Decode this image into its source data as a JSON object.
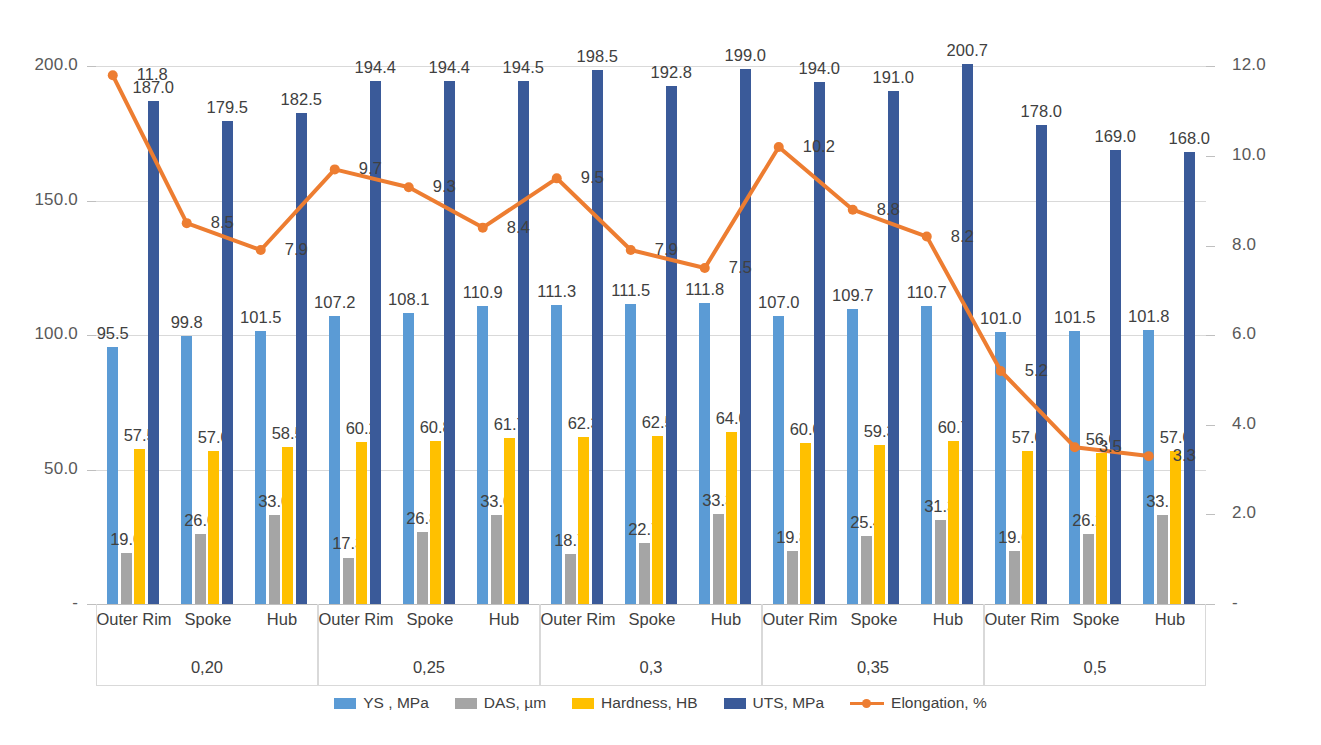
{
  "chart_data": {
    "type": "bar",
    "title": "",
    "subtitle": "",
    "xlabel": "",
    "ylabel": "",
    "y2label": "",
    "grid": true,
    "legend_position": "bottom",
    "groups": [
      "0,20",
      "0,25",
      "0,3",
      "0,35",
      "0,5"
    ],
    "subcategories": [
      "Outer Rim",
      "Spoke",
      "Hub"
    ],
    "categories": [
      "0,20 Outer Rim",
      "0,20 Spoke",
      "0,20 Hub",
      "0,25 Outer Rim",
      "0,25 Spoke",
      "0,25 Hub",
      "0,3 Outer Rim",
      "0,3 Spoke",
      "0,3 Hub",
      "0,35 Outer Rim",
      "0,35 Spoke",
      "0,35 Hub",
      "0,5 Outer Rim",
      "0,5 Spoke",
      "0,5 Hub"
    ],
    "axis_left": {
      "ticks": [
        "-",
        "50.0",
        "100.0",
        "150.0",
        "200.0"
      ],
      "values": [
        0,
        50,
        100,
        150,
        200
      ],
      "ylim": [
        0,
        215
      ]
    },
    "axis_right": {
      "ticks": [
        "-",
        "2.0",
        "4.0",
        "6.0",
        "8.0",
        "10.0",
        "12.0"
      ],
      "values": [
        0,
        2,
        4,
        6,
        8,
        10,
        12
      ],
      "ylim": [
        0,
        12.9
      ]
    },
    "series": [
      {
        "name": "YS , MPa",
        "type": "bar",
        "axis": "left",
        "color": "#5b9bd5",
        "values": [
          95.5,
          99.8,
          101.5,
          107.2,
          108.1,
          110.9,
          111.3,
          111.5,
          111.8,
          107.0,
          109.7,
          110.7,
          101.0,
          101.5,
          101.8
        ],
        "labels": [
          "95.5",
          "99.8",
          "101.5",
          "107.2",
          "108.1",
          "110.9",
          "111.3",
          "111.5",
          "111.8",
          "107.0",
          "109.7",
          "110.7",
          "101.0",
          "101.5",
          "101.8"
        ]
      },
      {
        "name": "DAS, µm",
        "type": "bar",
        "axis": "left",
        "color": "#a5a5a5",
        "values": [
          19.0,
          26.0,
          33.0,
          17.3,
          26.8,
          33.0,
          18.7,
          22.7,
          33.3,
          19.8,
          25.4,
          31.3,
          19.6,
          26.2,
          33.1
        ],
        "labels": [
          "19.0",
          "26.0",
          "33.0",
          "17.3",
          "26.8",
          "33.0",
          "18.7",
          "22.7",
          "33.3",
          "19.8",
          "25.4",
          "31.3",
          "19.6",
          "26.2",
          "33.1"
        ]
      },
      {
        "name": "Hardness, HB",
        "type": "bar",
        "axis": "left",
        "color": "#ffc000",
        "values": [
          57.5,
          57.0,
          58.5,
          60.2,
          60.8,
          61.7,
          62.3,
          62.5,
          64.0,
          60.0,
          59.3,
          60.7,
          57.0,
          56.0,
          57.0
        ],
        "labels": [
          "57.5",
          "57.0",
          "58.5",
          "60.2",
          "60.8",
          "61.7",
          "62.3",
          "62.5",
          "64.0",
          "60.0",
          "59.3",
          "60.7",
          "57.0",
          "56.0",
          "57.0"
        ]
      },
      {
        "name": "UTS, MPa",
        "type": "bar",
        "axis": "left",
        "color": "#3a5a99",
        "values": [
          187.0,
          179.5,
          182.5,
          194.4,
          194.4,
          194.5,
          198.5,
          192.8,
          199.0,
          194.0,
          191.0,
          200.7,
          178.0,
          169.0,
          168.0
        ],
        "labels": [
          "187.0",
          "179.5",
          "182.5",
          "194.4",
          "194.4",
          "194.5",
          "198.5",
          "192.8",
          "199.0",
          "194.0",
          "191.0",
          "200.7",
          "178.0",
          "169.0",
          "168.0"
        ]
      },
      {
        "name": "Elongation, %",
        "type": "line",
        "axis": "right",
        "color": "#ed7d31",
        "values": [
          11.8,
          8.5,
          7.9,
          9.7,
          9.3,
          8.4,
          9.5,
          7.9,
          7.5,
          10.2,
          8.8,
          8.2,
          5.2,
          3.5,
          3.3
        ],
        "labels": [
          "11.8",
          "8.5",
          "7.9",
          "9.7",
          "9.3",
          "8.4",
          "9.5",
          "7.9",
          "7.5",
          "10.2",
          "8.8",
          "8.2",
          "5.2",
          "3.5",
          "3.3"
        ]
      }
    ]
  },
  "legend": {
    "items": [
      {
        "label": "YS , MPa",
        "color": "#5b9bd5",
        "marker": "square"
      },
      {
        "label": "DAS, µm",
        "color": "#a5a5a5",
        "marker": "square"
      },
      {
        "label": "Hardness, HB",
        "color": "#ffc000",
        "marker": "square"
      },
      {
        "label": "UTS, MPa",
        "color": "#3a5a99",
        "marker": "square"
      },
      {
        "label": "Elongation, %",
        "color": "#ed7d31",
        "marker": "line"
      }
    ]
  }
}
